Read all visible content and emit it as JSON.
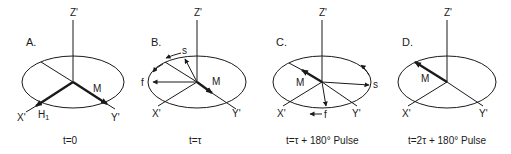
{
  "figure": {
    "panels": [
      {
        "id": "A",
        "label": "A.",
        "axes": {
          "z": "Z'",
          "x": "X'",
          "y": "Y'"
        },
        "vectors": [
          "M",
          "H1"
        ],
        "caption": "t=0"
      },
      {
        "id": "B",
        "label": "B.",
        "axes": {
          "z": "Z'",
          "x": "X'",
          "y": "Y'"
        },
        "vectors": [
          "M",
          "s",
          "f"
        ],
        "caption": "t=τ"
      },
      {
        "id": "C",
        "label": "C.",
        "axes": {
          "z": "Z'",
          "x": "X'",
          "y": "Y'"
        },
        "vectors": [
          "M",
          "s",
          "f"
        ],
        "caption": "t=τ + 180° Pulse"
      },
      {
        "id": "D",
        "label": "D.",
        "axes": {
          "z": "Z'",
          "x": "X'",
          "y": "Y'"
        },
        "vectors": [
          "M"
        ],
        "caption": "t=2τ + 180° Pulse"
      }
    ]
  },
  "labels": {
    "a": {
      "panel": "A.",
      "z": "Z'",
      "x": "X'",
      "y": "Y'",
      "m": "M",
      "h": "H",
      "h_sub": "1",
      "caption": "t=0"
    },
    "b": {
      "panel": "B.",
      "z": "Z'",
      "x": "X'",
      "y": "Y'",
      "m": "M",
      "s": "s",
      "f": "f",
      "caption": "t=τ"
    },
    "c": {
      "panel": "C.",
      "z": "Z'",
      "x": "X'",
      "y": "Y'",
      "m": "M",
      "s": "s",
      "f": "f",
      "caption": "t=τ + 180° Pulse"
    },
    "d": {
      "panel": "D.",
      "z": "Z'",
      "x": "X'",
      "y": "Y'",
      "m": "M",
      "caption": "t=2τ + 180° Pulse"
    }
  },
  "colors": {
    "ink": "#1a1a1a",
    "background": "#ffffff"
  }
}
